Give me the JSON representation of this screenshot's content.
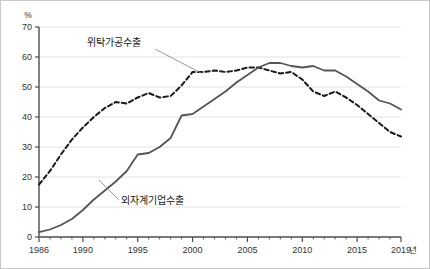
{
  "chart_data": {
    "type": "line",
    "title": "",
    "subtitle": "",
    "xlabel": "년",
    "ylabel": "%",
    "ylim": [
      0,
      70
    ],
    "xlim": [
      1986,
      2019
    ],
    "grid": true,
    "legend_position": "inline-annotation",
    "yticks": [
      0,
      10,
      20,
      30,
      40,
      50,
      60,
      70
    ],
    "ytick_labels": [
      "0",
      "10",
      "20",
      "30",
      "40",
      "50",
      "60",
      "70"
    ],
    "xticks": [
      1986,
      1990,
      1995,
      2000,
      2005,
      2010,
      2015,
      2019
    ],
    "xtick_labels": [
      "1986",
      "1990",
      "1995",
      "2000",
      "2005",
      "2010",
      "2015",
      "2019"
    ],
    "x": [
      1986,
      1987,
      1988,
      1989,
      1990,
      1991,
      1992,
      1993,
      1994,
      1995,
      1996,
      1997,
      1998,
      1999,
      2000,
      2001,
      2002,
      2003,
      2004,
      2005,
      2006,
      2007,
      2008,
      2009,
      2010,
      2011,
      2012,
      2013,
      2014,
      2015,
      2016,
      2017,
      2018,
      2019
    ],
    "series": [
      {
        "name": "위탁가공수출",
        "style": "dashed",
        "color": "#1a1a1a",
        "values": [
          17.5,
          22.0,
          27.5,
          32.5,
          36.5,
          40.0,
          43.0,
          45.0,
          44.5,
          46.5,
          48.0,
          46.5,
          47.0,
          50.5,
          55.0,
          55.0,
          55.5,
          55.0,
          55.5,
          56.5,
          56.5,
          55.5,
          54.5,
          55.0,
          52.5,
          48.5,
          47.0,
          48.5,
          46.5,
          44.0,
          41.0,
          38.0,
          35.0,
          33.5
        ]
      },
      {
        "name": "외자계기업수출",
        "style": "solid",
        "color": "#555555",
        "values": [
          1.6,
          2.5,
          4.0,
          6.0,
          9.0,
          12.5,
          15.5,
          18.5,
          22.0,
          27.5,
          28.0,
          30.0,
          33.0,
          40.5,
          41.0,
          43.5,
          46.0,
          48.5,
          51.5,
          54.0,
          56.5,
          58.0,
          58.0,
          57.0,
          56.5,
          57.0,
          55.5,
          55.5,
          53.5,
          51.0,
          48.5,
          45.5,
          44.5,
          42.5
        ]
      }
    ],
    "annotations": [
      {
        "text": "위탁가공수출",
        "label_x": 86,
        "label_y": 45,
        "leader_x1": 154,
        "leader_y1": 48,
        "leader_x2": 200,
        "leader_y2": 72
      },
      {
        "text": "외자계기업수출",
        "label_x": 120,
        "label_y": 203,
        "leader_x1": 118,
        "leader_y1": 199,
        "leader_x2": 98,
        "leader_y2": 179
      }
    ],
    "series_tail_values": {
      "위탁가공수출_end": 29.0,
      "외자계기업수출_end": 35.0
    }
  },
  "axis": {
    "unit_top_left": "%",
    "unit_bottom_right": "년"
  },
  "colors": {
    "gridline": "#e3e3e3",
    "axis": "#4d4d4d",
    "solid_series": "#555555",
    "dashed_series": "#1a1a1a",
    "leader": "#8c8c8c",
    "frame": "#c8c8c8",
    "text": "#333333"
  }
}
